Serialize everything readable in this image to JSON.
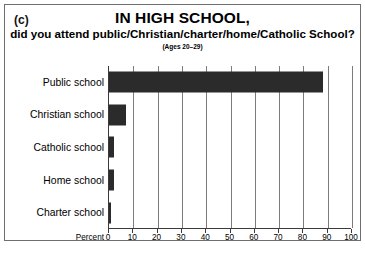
{
  "panel": {
    "letter": "(c)"
  },
  "header": {
    "title": "IN HIGH SCHOOL,",
    "subtitle": "did you attend public/Christian/charter/home/Catholic School?",
    "note": "(Ages 20–29)"
  },
  "axis": {
    "x_title": "Percent",
    "ticks": [
      "0",
      "10",
      "20",
      "30",
      "40",
      "50",
      "60",
      "70",
      "80",
      "90",
      "100"
    ]
  },
  "style": {
    "bar_color": "#2b2b2b",
    "grid_color": "#7c7c7c",
    "axis_color": "#3a3a3a",
    "frame_color": "#6e6e6e",
    "background": "#ffffff"
  },
  "chart_data": {
    "type": "bar",
    "orientation": "horizontal",
    "title": "IN HIGH SCHOOL,",
    "subtitle": "did you attend public/Christian/charter/home/Catholic School?",
    "note": "(Ages 20–29)",
    "categories": [
      "Public school",
      "Christian school",
      "Catholic school",
      "Home school",
      "Charter school"
    ],
    "values": [
      88,
      7,
      2,
      2,
      1
    ],
    "xlabel": "Percent",
    "ylabel": "",
    "xlim": [
      0,
      100
    ],
    "xticks": [
      0,
      10,
      20,
      30,
      40,
      50,
      60,
      70,
      80,
      90,
      100
    ],
    "grid": "vertical",
    "legend": "none"
  }
}
